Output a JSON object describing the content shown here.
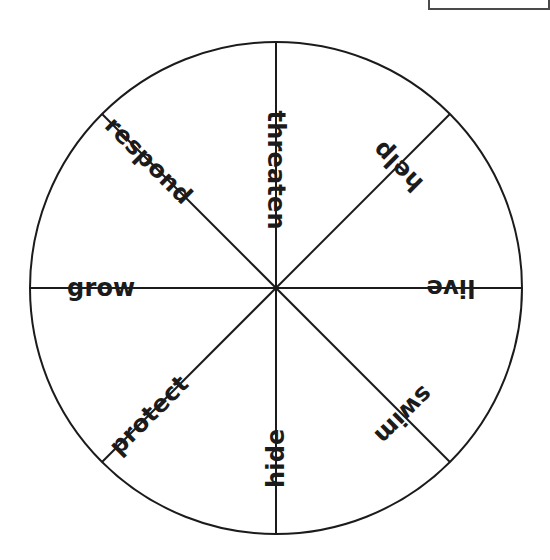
{
  "canvas": {
    "width": 550,
    "height": 560,
    "background": "#ffffff"
  },
  "clipped_panel": {
    "name": "partially-visible-panel",
    "visible_text": "",
    "border_color": "#4a4a4a"
  },
  "wheel": {
    "title": "",
    "center_x": 276,
    "center_y": 288,
    "radius": 246,
    "stroke_color": "#1b1b1b",
    "fill_color": "#ffffff",
    "stroke_width": 2,
    "segment_count": 8,
    "segments": [
      {
        "label": "threaten",
        "angle_deg": 270,
        "text_rotation_deg": 90,
        "radial_offset": 118
      },
      {
        "label": "help",
        "angle_deg": 315,
        "text_rotation_deg": 225,
        "radial_offset": 172
      },
      {
        "label": "live",
        "angle_deg": 0,
        "text_rotation_deg": 180,
        "radial_offset": 175
      },
      {
        "label": "swim",
        "angle_deg": 45,
        "text_rotation_deg": 135,
        "radial_offset": 180
      },
      {
        "label": "hide",
        "angle_deg": 90,
        "text_rotation_deg": 270,
        "radial_offset": 170
      },
      {
        "label": "protect",
        "angle_deg": 135,
        "text_rotation_deg": 315,
        "radial_offset": 180
      },
      {
        "label": "grow",
        "angle_deg": 180,
        "text_rotation_deg": 0,
        "radial_offset": 175
      },
      {
        "label": "respond",
        "angle_deg": 225,
        "text_rotation_deg": 45,
        "radial_offset": 180
      }
    ],
    "divider_angles_deg": [
      0,
      45,
      90,
      135,
      180,
      225,
      270,
      315
    ]
  },
  "chart_data": {
    "type": "pie",
    "title": "",
    "categories": [
      "threaten",
      "help",
      "live",
      "swim",
      "hide",
      "protect",
      "grow",
      "respond"
    ],
    "values": [
      12.5,
      12.5,
      12.5,
      12.5,
      12.5,
      12.5,
      12.5,
      12.5
    ],
    "units": "percent",
    "legend": "none",
    "grid": false
  }
}
